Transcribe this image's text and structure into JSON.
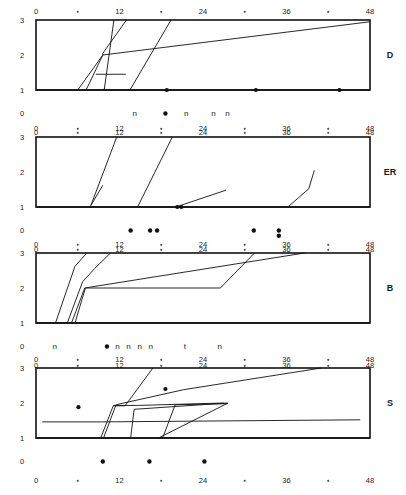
{
  "figure": {
    "title": "",
    "panel_count": 4,
    "background_color": "#ffffff",
    "ink_color": "#111111"
  },
  "axes": {
    "y_ticks": [
      "3",
      "2",
      "1",
      "0"
    ],
    "y_values": [
      3,
      2,
      1,
      0
    ],
    "x_ticks": [
      "0",
      "12",
      "24",
      "36",
      "48"
    ],
    "x_values": [
      0,
      12,
      24,
      36,
      48
    ],
    "x_minor_values": [
      6,
      18,
      30,
      42
    ],
    "xlim": [
      0,
      48
    ],
    "ylim": [
      0,
      3
    ],
    "xlabel": "",
    "ylabel": "",
    "grid": false
  },
  "chart_data": {
    "type": "line",
    "title": "",
    "xlabel": "",
    "ylabel": "",
    "xlim": [
      0,
      48
    ],
    "ylim": [
      0,
      3
    ],
    "x_ticks": [
      0,
      12,
      24,
      36,
      48
    ],
    "x_minor_ticks": [
      6,
      18,
      30,
      42
    ],
    "y_ticks": [
      0,
      1,
      2,
      3
    ],
    "grid": false,
    "legend": "none",
    "panels": [
      {
        "label": "D",
        "series": [
          {
            "name": "d-trace-1",
            "points": [
              [
                6.0,
                1.0
              ],
              [
                9.6,
                2.0
              ],
              [
                48.0,
                2.95
              ]
            ]
          },
          {
            "name": "d-trace-2",
            "points": [
              [
                7.2,
                1.0
              ],
              [
                9.6,
                2.0
              ],
              [
                9.6,
                2.05
              ],
              [
                13.0,
                3.0
              ]
            ]
          },
          {
            "name": "d-trace-3",
            "points": [
              [
                9.8,
                1.0
              ],
              [
                11.2,
                3.0
              ]
            ]
          },
          {
            "name": "d-trace-4",
            "points": [
              [
                13.5,
                1.0
              ],
              [
                19.4,
                3.0
              ]
            ]
          },
          {
            "name": "d-trace-5-step",
            "points": [
              [
                8.6,
                1.45
              ],
              [
                12.9,
                1.45
              ]
            ]
          },
          {
            "name": "d-baseline",
            "points": [
              [
                0.0,
                1.0
              ],
              [
                48.0,
                1.0
              ]
            ]
          }
        ],
        "baseline_dots": [
          18.8,
          31.6,
          43.6
        ],
        "annotations": [
          {
            "text": "n",
            "x": 14.2
          },
          {
            "text": "•",
            "x": 18.6
          },
          {
            "text": "n",
            "x": 21.6
          },
          {
            "text": "n",
            "x": 25.5
          },
          {
            "text": "n",
            "x": 27.5
          }
        ]
      },
      {
        "label": "ER",
        "series": [
          {
            "name": "er-trace-1",
            "points": [
              [
                7.8,
                1.0
              ],
              [
                11.6,
                3.0
              ]
            ]
          },
          {
            "name": "er-trace-2",
            "points": [
              [
                7.9,
                1.05
              ],
              [
                9.6,
                1.62
              ]
            ]
          },
          {
            "name": "er-trace-3",
            "points": [
              [
                14.6,
                1.0
              ],
              [
                19.6,
                3.0
              ]
            ]
          },
          {
            "name": "er-trace-4",
            "points": [
              [
                20.4,
                1.02
              ],
              [
                27.3,
                1.48
              ]
            ]
          },
          {
            "name": "er-trace-5",
            "points": [
              [
                36.2,
                1.0
              ],
              [
                39.2,
                1.52
              ],
              [
                40.0,
                2.05
              ]
            ]
          },
          {
            "name": "er-baseline",
            "points": [
              [
                0.0,
                1.0
              ],
              [
                48.0,
                1.0
              ]
            ]
          }
        ],
        "baseline_dots": [
          20.3,
          20.9
        ],
        "annotations": [
          {
            "text": "•",
            "x": 13.6
          },
          {
            "text": "•",
            "x": 16.4
          },
          {
            "text": "•",
            "x": 17.4
          },
          {
            "text": "•",
            "x": 31.3
          },
          {
            "text": "•",
            "x": 34.9
          },
          {
            "text": "•",
            "x": 34.9
          }
        ]
      },
      {
        "label": "B",
        "series": [
          {
            "name": "b-trace-1",
            "points": [
              [
                2.8,
                1.0
              ],
              [
                5.6,
                2.62
              ],
              [
                7.3,
                3.0
              ]
            ]
          },
          {
            "name": "b-trace-2",
            "points": [
              [
                4.5,
                1.0
              ],
              [
                6.7,
                2.18
              ],
              [
                8.4,
                2.55
              ],
              [
                10.7,
                3.0
              ]
            ]
          },
          {
            "name": "b-trace-3",
            "points": [
              [
                5.1,
                1.0
              ],
              [
                7.0,
                2.0
              ],
              [
                38.6,
                3.0
              ]
            ]
          },
          {
            "name": "b-trace-4",
            "points": [
              [
                5.6,
                1.0
              ],
              [
                7.1,
                2.0
              ],
              [
                26.5,
                2.0
              ],
              [
                31.4,
                3.0
              ]
            ]
          },
          {
            "name": "b-baseline",
            "points": [
              [
                0.0,
                1.0
              ],
              [
                48.0,
                1.0
              ]
            ]
          }
        ],
        "baseline_dots": [],
        "annotations": [
          {
            "text": "n",
            "x": 2.7
          },
          {
            "text": "•",
            "x": 10.2
          },
          {
            "text": "n",
            "x": 11.7
          },
          {
            "text": "n",
            "x": 13.3
          },
          {
            "text": "n",
            "x": 14.9
          },
          {
            "text": "n",
            "x": 16.5
          },
          {
            "text": "t",
            "x": 21.4
          },
          {
            "text": "n",
            "x": 26.4
          }
        ]
      },
      {
        "label": "S",
        "series": [
          {
            "name": "s-trace-1",
            "points": [
              [
                9.3,
                1.0
              ],
              [
                11.1,
                1.92
              ],
              [
                12.8,
                1.92
              ],
              [
                16.8,
                3.0
              ]
            ]
          },
          {
            "name": "s-trace-2",
            "points": [
              [
                9.7,
                1.0
              ],
              [
                11.5,
                1.95
              ],
              [
                21.2,
                2.38
              ],
              [
                41.0,
                3.0
              ]
            ]
          },
          {
            "name": "s-trace-3",
            "points": [
              [
                13.6,
                1.0
              ],
              [
                14.1,
                1.82
              ],
              [
                27.5,
                2.0
              ]
            ]
          },
          {
            "name": "s-trace-4",
            "points": [
              [
                17.6,
                1.0
              ],
              [
                27.6,
                2.0
              ]
            ]
          },
          {
            "name": "s-trace-5",
            "points": [
              [
                18.2,
                1.0
              ],
              [
                20.0,
                1.95
              ],
              [
                27.6,
                1.98
              ]
            ]
          },
          {
            "name": "s-trace-6-long",
            "points": [
              [
                0.9,
                1.46
              ],
              [
                9.4,
                1.46
              ],
              [
                46.6,
                1.52
              ]
            ]
          },
          {
            "name": "s-trace-7",
            "points": [
              [
                11.1,
                1.93
              ],
              [
                14.6,
                1.93
              ],
              [
                27.0,
                2.0
              ]
            ]
          },
          {
            "name": "s-baseline",
            "points": [
              [
                0.0,
                1.0
              ],
              [
                48.0,
                1.0
              ]
            ]
          }
        ],
        "baseline_dots": [],
        "inline_dots": [
          [
            6.1,
            1.88
          ],
          [
            18.6,
            2.4
          ]
        ],
        "annotations": [
          {
            "text": "•",
            "x": 9.6
          },
          {
            "text": "•",
            "x": 16.3
          },
          {
            "text": "•",
            "x": 24.2
          }
        ]
      }
    ]
  }
}
